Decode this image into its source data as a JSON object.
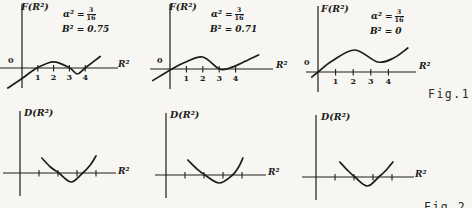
{
  "page": {
    "background": "#f7f6f2",
    "ink": "#1c1c1c",
    "fig1_label": "Fig.1",
    "fig2_label": "Fig.2"
  },
  "chart_data": [
    {
      "type": "line",
      "name": "F(R2) curve, B2=0.75",
      "ylabel": "F(R²)",
      "xlabel": "R²",
      "origin_label": "0",
      "annotation": {
        "lhs": "α² =",
        "num": "3",
        "den": "16",
        "line2": "B² = 0.75"
      },
      "x_ticks": [
        {
          "v": 1,
          "label": "1"
        },
        {
          "v": 2,
          "label": "2"
        },
        {
          "v": 3,
          "label": "3"
        },
        {
          "v": 4,
          "label": "4"
        }
      ],
      "xlim": [
        -1,
        5.5
      ],
      "ylim": [
        -2.2,
        1.5
      ],
      "zeros": [
        1,
        4
      ],
      "curve_points": [
        [
          -0.9,
          -2.0
        ],
        [
          0,
          -1.05
        ],
        [
          0.95,
          0
        ],
        [
          2,
          0.62
        ],
        [
          3,
          0.02
        ],
        [
          3.5,
          -0.6
        ],
        [
          4,
          0
        ],
        [
          4.95,
          1.15
        ]
      ]
    },
    {
      "type": "line",
      "name": "F(R2) curve, B2=0.71",
      "ylabel": "F(R²)",
      "xlabel": "R²",
      "origin_label": "0",
      "annotation": {
        "lhs": "α² =",
        "num": "3",
        "den": "16",
        "line2": "B² = 0.71"
      },
      "x_ticks": [
        {
          "v": 1,
          "label": "1"
        },
        {
          "v": 2,
          "label": "2"
        },
        {
          "v": 3,
          "label": "3"
        },
        {
          "v": 4,
          "label": "4"
        }
      ],
      "xlim": [
        -1,
        5.5
      ],
      "ylim": [
        -1.3,
        1.5
      ],
      "zeros": [
        0.1,
        3
      ],
      "curve_points": [
        [
          -1.04,
          -1.15
        ],
        [
          0.12,
          0
        ],
        [
          1.0,
          0.72
        ],
        [
          2.0,
          1.2
        ],
        [
          3.0,
          0.02
        ],
        [
          3.6,
          0.08
        ],
        [
          4.4,
          0.62
        ],
        [
          5.4,
          1.4
        ]
      ]
    },
    {
      "type": "line",
      "name": "F(R2) curve, B2=0",
      "ylabel": "F(R²)",
      "xlabel": "R²",
      "origin_label": "0",
      "annotation": {
        "lhs": "α² =",
        "num": "3",
        "den": "16",
        "line2": "B² = 0"
      },
      "x_ticks": [
        {
          "v": 1,
          "label": "1"
        },
        {
          "v": 2,
          "label": "2"
        },
        {
          "v": 3,
          "label": "3"
        },
        {
          "v": 4,
          "label": "4"
        }
      ],
      "xlim": [
        -0.5,
        5.5
      ],
      "ylim": [
        -0.6,
        2.5
      ],
      "zeros": [
        0
      ],
      "curve_points": [
        [
          -0.35,
          -0.5
        ],
        [
          0,
          0
        ],
        [
          0.8,
          1.1
        ],
        [
          2.1,
          2.2
        ],
        [
          3.4,
          1.0
        ],
        [
          4.3,
          1.4
        ],
        [
          5.1,
          2.4
        ]
      ]
    },
    {
      "type": "line",
      "name": "D(R2) curve, left",
      "ylabel": "D(R²)",
      "xlabel": "R²",
      "x_ticks": [
        {
          "v": 1,
          "label": ""
        },
        {
          "v": 2,
          "label": ""
        },
        {
          "v": 3,
          "label": ""
        },
        {
          "v": 4,
          "label": ""
        }
      ],
      "xlim": [
        0,
        4.5
      ],
      "ylim": [
        -1.1,
        1.8
      ],
      "zeros": [
        2.05,
        3.3
      ],
      "curve_points": [
        [
          1.15,
          1.5
        ],
        [
          1.6,
          0.6
        ],
        [
          2.05,
          0
        ],
        [
          2.7,
          -0.9
        ],
        [
          3.3,
          0
        ],
        [
          3.7,
          0.8
        ],
        [
          4.0,
          1.7
        ]
      ]
    },
    {
      "type": "line",
      "name": "D(R2) curve, middle",
      "ylabel": "D(R²)",
      "xlabel": "R²",
      "x_ticks": [
        {
          "v": 1,
          "label": ""
        },
        {
          "v": 2,
          "label": ""
        },
        {
          "v": 3,
          "label": ""
        },
        {
          "v": 4,
          "label": ""
        }
      ],
      "xlim": [
        0,
        4.5
      ],
      "ylim": [
        -1.0,
        1.8
      ],
      "zeros": [
        2.05,
        3.5
      ],
      "curve_points": [
        [
          1.15,
          1.5
        ],
        [
          1.6,
          0.65
        ],
        [
          2.05,
          0
        ],
        [
          2.8,
          -0.8
        ],
        [
          3.5,
          0
        ],
        [
          3.82,
          0.8
        ],
        [
          4.05,
          1.7
        ]
      ]
    },
    {
      "type": "line",
      "name": "D(R2) curve, right",
      "ylabel": "D(R²)",
      "xlabel": "R²",
      "x_ticks": [
        {
          "v": 1,
          "label": ""
        },
        {
          "v": 2,
          "label": ""
        },
        {
          "v": 3,
          "label": ""
        },
        {
          "v": 4,
          "label": ""
        }
      ],
      "xlim": [
        0,
        4.5
      ],
      "ylim": [
        -1.1,
        1.6
      ],
      "zeros": [
        2.05,
        3.3
      ],
      "curve_points": [
        [
          1.25,
          1.5
        ],
        [
          1.7,
          0.6
        ],
        [
          2.05,
          0
        ],
        [
          2.7,
          -0.9
        ],
        [
          3.3,
          0
        ],
        [
          3.7,
          0.7
        ],
        [
          4.05,
          1.5
        ]
      ]
    }
  ]
}
